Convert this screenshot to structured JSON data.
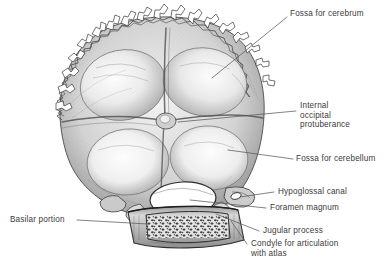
{
  "figure": {
    "background_color": "#ffffff",
    "ink_color": "#3b3b3b",
    "leader_color": "#5a5a5a",
    "bone_tone_light": "#fbfbfb",
    "bone_tone_mid": "#b9b9b9",
    "bone_tone_dark": "#6f6f6f"
  },
  "labels": {
    "fossa_cerebrum": "Fossa for cerebrum",
    "internal_occipital_protuberance": "Internal\noccipital\nprotuberance",
    "fossa_cerebellum": "Fossa for cerebellum",
    "hypoglossal_canal": "Hypoglossal canal",
    "foramen_magnum": "Foramen magnum",
    "jugular_process": "Jugular process",
    "condyle_for_articulation": "Condyle for articulation\nwith atlas",
    "basilar_portion": "Basilar portion"
  },
  "structures": [
    {
      "name": "fossa-for-cerebrum",
      "label": "Fossa for cerebrum",
      "side": "right",
      "count": 2
    },
    {
      "name": "internal-occipital-protuberance",
      "label": "Internal occipital protuberance",
      "side": "right"
    },
    {
      "name": "fossa-for-cerebellum",
      "label": "Fossa for cerebellum",
      "side": "right",
      "count": 2
    },
    {
      "name": "hypoglossal-canal",
      "label": "Hypoglossal canal",
      "side": "right"
    },
    {
      "name": "foramen-magnum",
      "label": "Foramen magnum",
      "side": "right"
    },
    {
      "name": "jugular-process",
      "label": "Jugular process",
      "side": "right"
    },
    {
      "name": "condyle-for-articulation-with-atlas",
      "label": "Condyle for articulation with atlas",
      "side": "right"
    },
    {
      "name": "basilar-portion",
      "label": "Basilar portion",
      "side": "left"
    },
    {
      "name": "lambdoid-suture-margin",
      "label": "Serrated suture margin",
      "side": "none"
    }
  ]
}
